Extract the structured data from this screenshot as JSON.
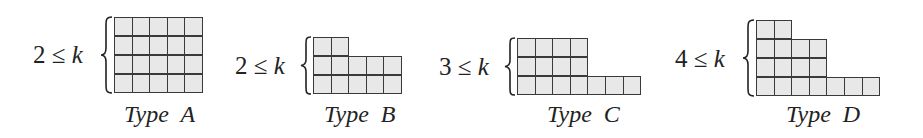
{
  "figure": {
    "cell_fill": "#e8e8e8",
    "cell_border": "#3a3a3a",
    "panels": [
      {
        "id": "A",
        "condition": {
          "lower": "2",
          "relation": "≤",
          "variable": "k"
        },
        "label": "Type A",
        "row_lengths_top_to_bottom": [
          5,
          5,
          5,
          5
        ]
      },
      {
        "id": "B",
        "condition": {
          "lower": "2",
          "relation": "≤",
          "variable": "k"
        },
        "label": "Type B",
        "row_lengths_top_to_bottom": [
          2,
          5,
          5
        ]
      },
      {
        "id": "C",
        "condition": {
          "lower": "3",
          "relation": "≤",
          "variable": "k"
        },
        "label": "Type C",
        "row_lengths_top_to_bottom": [
          4,
          4,
          7
        ]
      },
      {
        "id": "D",
        "condition": {
          "lower": "4",
          "relation": "≤",
          "variable": "k"
        },
        "label": "Type D",
        "row_lengths_top_to_bottom": [
          2,
          4,
          4,
          7
        ]
      }
    ]
  }
}
